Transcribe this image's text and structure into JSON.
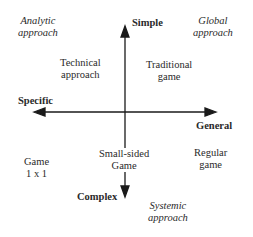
{
  "axes": {
    "top": "Simple",
    "bottom": "Complex",
    "left": "Specific",
    "right": "General"
  },
  "corners": {
    "top_left": [
      "Analytic",
      "approach"
    ],
    "top_right": [
      "Global",
      "approach"
    ],
    "bottom_right": [
      "Systemic",
      "approach"
    ]
  },
  "quadrants": {
    "upper_left": [
      "Technical",
      "approach"
    ],
    "upper_right": [
      "Traditional",
      "game"
    ],
    "lower_left": [
      "Game",
      "1 x 1"
    ],
    "lower_center": [
      "Small-sided",
      "Game"
    ],
    "lower_right": [
      "Regular",
      "game"
    ]
  }
}
